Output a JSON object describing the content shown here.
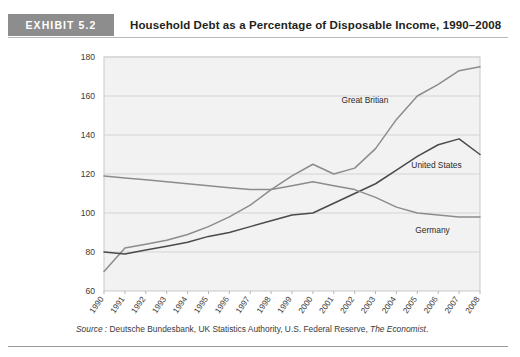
{
  "header": {
    "exhibit_label": "EXHIBIT 5.2",
    "title": "Household Debt as a Percentage of Disposable Income, 1990–2008",
    "badge_color": "#8d8d8d"
  },
  "source": {
    "prefix": "Source :",
    "text": " Deutsche Bundesbank, UK Statistics Authority, U.S. Federal Reserve, ",
    "italic_tail": "The Economist",
    "period": "."
  },
  "chart_data": {
    "type": "line",
    "title": "Household Debt as a Percentage of Disposable Income, 1990–2008",
    "xlabel": "",
    "ylabel": "",
    "ylim": [
      60,
      180
    ],
    "yticks": [
      60,
      80,
      100,
      120,
      140,
      160,
      180
    ],
    "grid": true,
    "legend": "inline-labels",
    "categories": [
      "1990",
      "1991",
      "1992",
      "1993",
      "1994",
      "1995",
      "1996",
      "1997",
      "1998",
      "1999",
      "2000",
      "2001",
      "2002",
      "2003",
      "2004",
      "2005",
      "2006",
      "2007",
      "2008"
    ],
    "series": [
      {
        "name": "Great Britian",
        "color": "#8c8c8c",
        "label_x_index": 14,
        "values": [
          70,
          82,
          84,
          86,
          89,
          93,
          98,
          104,
          112,
          119,
          125,
          120,
          123,
          133,
          148,
          160,
          166,
          173,
          175
        ]
      },
      {
        "name": "United States",
        "color": "#4a4a4a",
        "label_x_index": 15,
        "values": [
          80,
          79,
          81,
          83,
          85,
          88,
          90,
          93,
          96,
          99,
          100,
          105,
          110,
          115,
          122,
          129,
          135,
          138,
          130
        ]
      },
      {
        "name": "Germany",
        "color": "#8c8c8c",
        "label_x_index": 15,
        "values": [
          119,
          118,
          117,
          116,
          115,
          114,
          113,
          112,
          112,
          114,
          116,
          114,
          112,
          108,
          103,
          100,
          99,
          98,
          98
        ]
      }
    ]
  },
  "axis_labels": {
    "y": [
      "180",
      "160",
      "140",
      "120",
      "100",
      "80",
      "60"
    ],
    "x": [
      "1990",
      "1991",
      "1992",
      "1993",
      "1994",
      "1995",
      "1996",
      "1997",
      "1998",
      "1999",
      "2000",
      "2001",
      "2002",
      "2003",
      "2004",
      "2005",
      "2006",
      "2007",
      "2008"
    ]
  }
}
